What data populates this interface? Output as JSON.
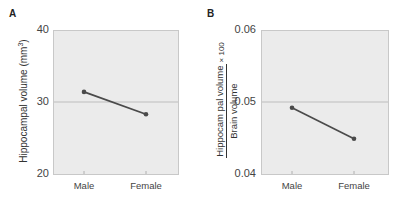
{
  "chart_data": [
    {
      "panel": "A",
      "type": "line",
      "categories": [
        "Male",
        "Female"
      ],
      "series": [
        {
          "name": "Hippocampal volume",
          "values": [
            31.4,
            28.3
          ]
        }
      ],
      "ylabel": "Hippocampal volume (mm³)",
      "xlabel": "",
      "ylim": [
        20,
        40
      ],
      "yticks": [
        "20",
        "30",
        "40"
      ],
      "reference_line": 30,
      "grid": false
    },
    {
      "panel": "B",
      "type": "line",
      "categories": [
        "Male",
        "Female"
      ],
      "series": [
        {
          "name": "Hippocampal volume / Brain volume × 100",
          "values": [
            0.0492,
            0.0449
          ]
        }
      ],
      "ylabel": "Hippocampal volume / Brain volume × 100",
      "xlabel": "",
      "ylim": [
        0.04,
        0.06
      ],
      "yticks": [
        "0.04",
        "0.05",
        "0.06"
      ],
      "reference_line": 0.05,
      "grid": false
    }
  ],
  "panels": {
    "a": {
      "label": "A",
      "ylabel_main": "Hippocampal volume (mm",
      "ylabel_sup": "3",
      "ylabel_close": ")",
      "yticks": {
        "top": "40",
        "mid": "30",
        "bottom": "20"
      },
      "xticks": {
        "male": "Male",
        "female": "Female"
      }
    },
    "b": {
      "label": "B",
      "ylabel_num": "Hippocam pal volume",
      "ylabel_den": "Brain volume",
      "ylabel_mult": "× 100",
      "yticks": {
        "top": "0.06",
        "mid": "0.05",
        "bottom": "0.04"
      },
      "xticks": {
        "male": "Male",
        "female": "Female"
      }
    }
  },
  "colors": {
    "plot_bg": "#ebebeb",
    "line": "#4a4a4a",
    "reference_line": "#bdbdbd",
    "frame": "#c8c8c8"
  }
}
